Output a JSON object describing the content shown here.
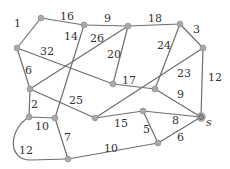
{
  "diagram": {
    "type": "weighted-undirected-graph",
    "colors": {
      "edge": "#6e6e6e",
      "node": "#a9a9a9",
      "label": "#333333",
      "background": "#ffffff"
    },
    "nodes": [
      {
        "id": "n1",
        "x": 41,
        "y": 18
      },
      {
        "id": "n2",
        "x": 84,
        "y": 25
      },
      {
        "id": "n3",
        "x": 128,
        "y": 26
      },
      {
        "id": "n4",
        "x": 180,
        "y": 24
      },
      {
        "id": "n5",
        "x": 203,
        "y": 48
      },
      {
        "id": "n6",
        "x": 17,
        "y": 48
      },
      {
        "id": "n7",
        "x": 30,
        "y": 89
      },
      {
        "id": "n8",
        "x": 113,
        "y": 84
      },
      {
        "id": "n9",
        "x": 155,
        "y": 89
      },
      {
        "id": "n10",
        "x": 95,
        "y": 118
      },
      {
        "id": "n11",
        "x": 143,
        "y": 111
      },
      {
        "id": "s",
        "x": 201,
        "y": 117,
        "label": "s"
      },
      {
        "id": "n12",
        "x": 29,
        "y": 117
      },
      {
        "id": "n13",
        "x": 55,
        "y": 118
      },
      {
        "id": "n14",
        "x": 68,
        "y": 159
      },
      {
        "id": "n15",
        "x": 158,
        "y": 143
      }
    ],
    "edges": [
      {
        "from": "n6",
        "to": "n1",
        "weight": "1",
        "lx": 14,
        "ly": 27
      },
      {
        "from": "n1",
        "to": "n2",
        "weight": "16",
        "lx": 60,
        "ly": 20
      },
      {
        "from": "n2",
        "to": "n3",
        "weight": "9",
        "lx": 104,
        "ly": 22
      },
      {
        "from": "n3",
        "to": "n4",
        "weight": "18",
        "lx": 148,
        "ly": 22
      },
      {
        "from": "n4",
        "to": "n5",
        "weight": "3",
        "lx": 193,
        "ly": 33
      },
      {
        "from": "n2",
        "to": "n13",
        "weight": "14",
        "lx": 64,
        "ly": 40
      },
      {
        "from": "n3",
        "to": "n7",
        "weight": "26",
        "lx": 90,
        "ly": 42
      },
      {
        "from": "n6",
        "to": "n8",
        "weight": "32",
        "lx": 40,
        "ly": 55
      },
      {
        "from": "n3",
        "to": "n8",
        "weight": "20",
        "lx": 107,
        "ly": 58
      },
      {
        "from": "n4",
        "to": "n9",
        "weight": "24",
        "lx": 157,
        "ly": 49
      },
      {
        "from": "n6",
        "to": "n7",
        "weight": "6",
        "lx": 25,
        "ly": 74
      },
      {
        "from": "n8",
        "to": "n9",
        "weight": "17",
        "lx": 122,
        "ly": 84
      },
      {
        "from": "n5",
        "to": "n10",
        "weight": "23",
        "lx": 177,
        "ly": 77
      },
      {
        "from": "n5",
        "to": "s",
        "weight": "12",
        "lx": 208,
        "ly": 81
      },
      {
        "from": "n7",
        "to": "n10",
        "weight": "25",
        "lx": 69,
        "ly": 104
      },
      {
        "from": "n9",
        "to": "s",
        "weight": "9",
        "lx": 177,
        "ly": 98
      },
      {
        "from": "n7",
        "to": "n12",
        "weight": "2",
        "lx": 31,
        "ly": 108
      },
      {
        "from": "n10",
        "to": "n11",
        "weight": "15",
        "lx": 114,
        "ly": 127
      },
      {
        "from": "n11",
        "to": "s",
        "weight": "8",
        "lx": 172,
        "ly": 124
      },
      {
        "from": "n11",
        "to": "n15",
        "weight": "5",
        "lx": 143,
        "ly": 133
      },
      {
        "from": "n12",
        "to": "n13",
        "weight": "10",
        "lx": 35,
        "ly": 130
      },
      {
        "from": "n13",
        "to": "n14",
        "weight": "7",
        "lx": 64,
        "ly": 141
      },
      {
        "from": "n15",
        "to": "s",
        "weight": "6",
        "lx": 177,
        "ly": 141
      },
      {
        "from": "n14",
        "to": "n15",
        "weight": "10",
        "lx": 104,
        "ly": 152
      },
      {
        "from": "n12",
        "to": "n14",
        "weight": "12",
        "lx": 19,
        "ly": 154,
        "curved": true
      }
    ],
    "special_label": {
      "text": "s",
      "x": 206,
      "y": 126
    }
  }
}
